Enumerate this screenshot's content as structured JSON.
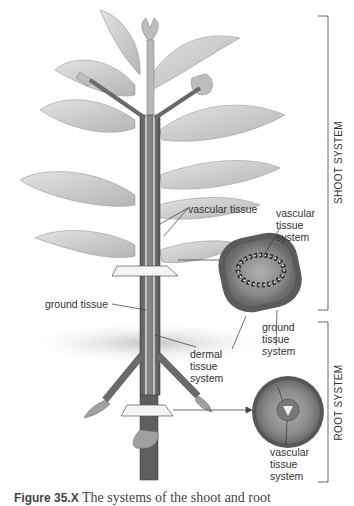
{
  "diagram": {
    "type": "plant anatomy illustration",
    "brackets": [
      {
        "label": "SHOOT SYSTEM",
        "top": 16,
        "bottom": 310
      },
      {
        "label": "ROOT SYSTEM",
        "top": 322,
        "bottom": 482
      }
    ],
    "labels": {
      "vascular_tissue": "vascular tissue",
      "vascular_tissue_system_top": "vascular\ntissue\nsystem",
      "ground_tissue": "ground tissue",
      "ground_tissue_system": "ground\ntissue\nsystem",
      "dermal_tissue_system": "dermal\ntissue\nsystem",
      "vascular_tissue_system_bottom": "vascular\ntissue\nsystem"
    },
    "cross_sections": [
      {
        "name": "stem cross-section",
        "shape": "rounded square",
        "vascular_bundles": 16
      },
      {
        "name": "root cross-section",
        "shape": "circle",
        "vascular_core": "central"
      }
    ],
    "caption": {
      "figure": "Figure 35.X",
      "text": "The systems of the shoot and root"
    },
    "colors": {
      "leaf": "#c9c9c9",
      "stem": "#6e6e6e",
      "section_outer": "#5a5a5a",
      "section_inner": "#8e8e8e",
      "soil": "#bdbdbd",
      "line": "#444444"
    }
  }
}
